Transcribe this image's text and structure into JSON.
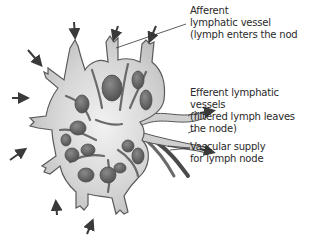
{
  "diagram": {
    "subject": "Lymph node",
    "colors": {
      "node_fill": "#d4d4d4",
      "node_outline": "#5a5a5a",
      "follicle_fill": "#6a6a6a",
      "follicle_dark": "#4a4a4a",
      "arrow": "#3a3a3a",
      "label_text": "#2a2a2a",
      "leader_line": "#333333",
      "background": "#ffffff"
    },
    "labels": [
      {
        "id": "afferent",
        "lines": [
          "Afferent",
          "lymphatic vessel",
          "(lymph enters the node)"
        ]
      },
      {
        "id": "efferent",
        "lines": [
          "Efferent lymphatic",
          "vessels",
          "(filtered lymph leaves",
          "the node)"
        ]
      },
      {
        "id": "vascular",
        "lines": [
          "Vascular supply",
          "for lymph node"
        ]
      }
    ],
    "arrow_count_afferent": 7
  }
}
